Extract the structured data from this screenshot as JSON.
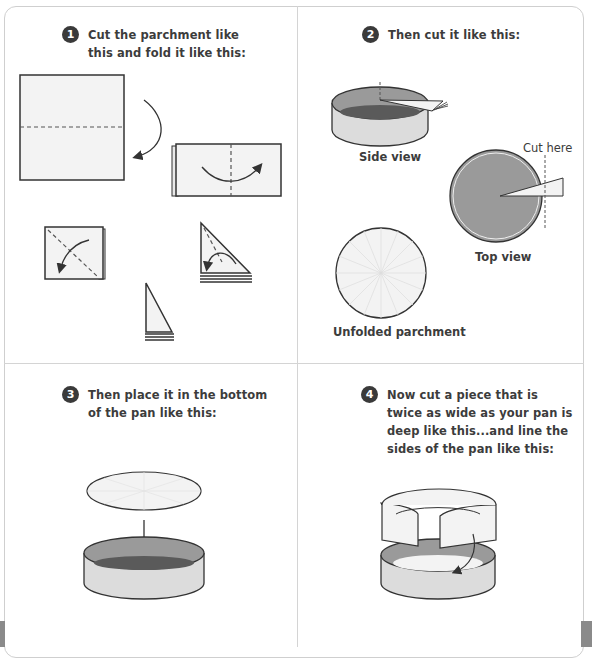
{
  "steps": [
    {
      "number": "1",
      "text_line1": "Cut the parchment like",
      "text_line2": "this and fold it like this:"
    },
    {
      "number": "2",
      "text_line1": "Then cut it like this:"
    },
    {
      "number": "3",
      "text_line1": "Then place it in the bottom",
      "text_line2": "of the pan like this:"
    },
    {
      "number": "4",
      "text_line1": "Now cut a piece that is",
      "text_line2": "twice as wide as your pan is",
      "text_line3": "deep like this...and line the",
      "text_line4": "sides of the pan like this:"
    }
  ],
  "captions": {
    "side_view": "Side view",
    "top_view": "Top view",
    "cut_here": "Cut here",
    "unfolded": "Unfolded parchment"
  },
  "colors": {
    "badge": "#3a3a3a",
    "paper": "#f3f3f3",
    "pan_inner": "#9a9a9a",
    "pan_bottom": "#5a5a5a",
    "pan_side": "#dcdcdc",
    "divider": "#d4d4d4"
  }
}
